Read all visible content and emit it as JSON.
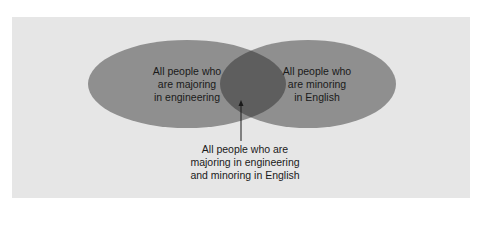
{
  "diagram": {
    "type": "venn",
    "colors": {
      "panel_background": "#e6e6e6",
      "set_fill": "#8f8f8f",
      "intersection_fill": "#5e5e5e",
      "arrow": "#1a1a1a"
    },
    "sets": [
      {
        "id": "left",
        "label": "All people who are majoring in engineering",
        "lines": [
          "All people who",
          "are majoring",
          "in engineering"
        ]
      },
      {
        "id": "right",
        "label": "All people who are minoring in English",
        "lines": [
          "All people who",
          "are minoring",
          "in English"
        ]
      }
    ],
    "intersection": {
      "label": "All people who are majoring in engineering and minoring in English",
      "lines": [
        "All people who are",
        "majoring in engineering",
        "and minoring in English"
      ]
    }
  }
}
